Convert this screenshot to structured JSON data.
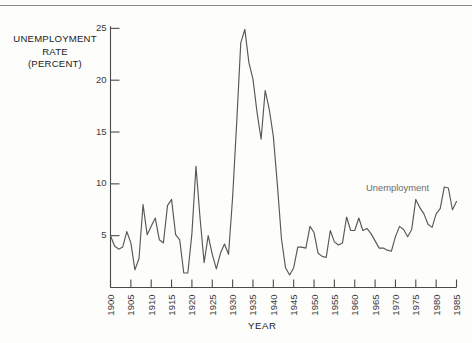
{
  "axis_titles": {
    "y_line1": "UNEMPLOYMENT",
    "y_line2": "RATE",
    "y_line3": "(PERCENT)",
    "x": "YEAR"
  },
  "annotations": {
    "series_label": "Unemployment"
  },
  "colors": {
    "line": "#575757",
    "axis": "#4a4a4a",
    "label": "#222222",
    "annotation": "#6a6a6a",
    "background": "#fdfdfc",
    "rule": "#8a8a8a"
  },
  "chart_data": {
    "type": "line",
    "title": "",
    "subtitle": "",
    "xlabel": "YEAR",
    "ylabel": "UNEMPLOYMENT RATE (PERCENT)",
    "grid": false,
    "legend_position": "inline-annotation",
    "xlim": [
      1900,
      1985
    ],
    "ylim": [
      0,
      26
    ],
    "yticks": [
      5,
      10,
      15,
      20,
      25
    ],
    "ytick_labels": [
      "5",
      "10",
      "15",
      "20",
      "25"
    ],
    "xticks": [
      1900,
      1905,
      1910,
      1915,
      1920,
      1925,
      1930,
      1935,
      1940,
      1945,
      1950,
      1955,
      1960,
      1965,
      1970,
      1975,
      1980,
      1985
    ],
    "xtick_labels": [
      "1900",
      "1905",
      "1910",
      "1915",
      "1920",
      "1925",
      "1930",
      "1935",
      "1940",
      "1945",
      "1950",
      "1955",
      "1960",
      "1965",
      "1970",
      "1975",
      "1980",
      "1985"
    ],
    "series": [
      {
        "name": "Unemployment",
        "x": [
          1900,
          1901,
          1902,
          1903,
          1904,
          1905,
          1906,
          1907,
          1908,
          1909,
          1910,
          1911,
          1912,
          1913,
          1914,
          1915,
          1916,
          1917,
          1918,
          1919,
          1920,
          1921,
          1922,
          1923,
          1924,
          1925,
          1926,
          1927,
          1928,
          1929,
          1930,
          1931,
          1932,
          1933,
          1934,
          1935,
          1936,
          1937,
          1938,
          1939,
          1940,
          1941,
          1942,
          1943,
          1944,
          1945,
          1946,
          1947,
          1948,
          1949,
          1950,
          1951,
          1952,
          1953,
          1954,
          1955,
          1956,
          1957,
          1958,
          1959,
          1960,
          1961,
          1962,
          1963,
          1964,
          1965,
          1966,
          1967,
          1968,
          1969,
          1970,
          1971,
          1972,
          1973,
          1974,
          1975,
          1976,
          1977,
          1978,
          1979,
          1980,
          1981,
          1982,
          1983,
          1984,
          1985
        ],
        "values": [
          5.0,
          4.0,
          3.7,
          3.9,
          5.4,
          4.3,
          1.7,
          2.8,
          8.0,
          5.1,
          5.9,
          6.7,
          4.6,
          4.3,
          7.9,
          8.5,
          5.1,
          4.6,
          1.4,
          1.4,
          5.2,
          11.7,
          6.7,
          2.4,
          5.0,
          3.2,
          1.8,
          3.3,
          4.2,
          3.2,
          8.7,
          15.9,
          23.6,
          24.9,
          21.7,
          20.1,
          16.9,
          14.3,
          19.0,
          17.2,
          14.6,
          9.9,
          4.7,
          1.9,
          1.2,
          1.9,
          3.9,
          3.9,
          3.8,
          5.9,
          5.3,
          3.3,
          3.0,
          2.9,
          5.5,
          4.4,
          4.1,
          4.3,
          6.8,
          5.5,
          5.5,
          6.7,
          5.5,
          5.7,
          5.2,
          4.5,
          3.8,
          3.8,
          3.6,
          3.5,
          4.9,
          5.9,
          5.6,
          4.9,
          5.6,
          8.5,
          7.7,
          7.1,
          6.1,
          5.8,
          7.1,
          7.6,
          9.7,
          9.6,
          7.5,
          8.3
        ]
      }
    ]
  }
}
